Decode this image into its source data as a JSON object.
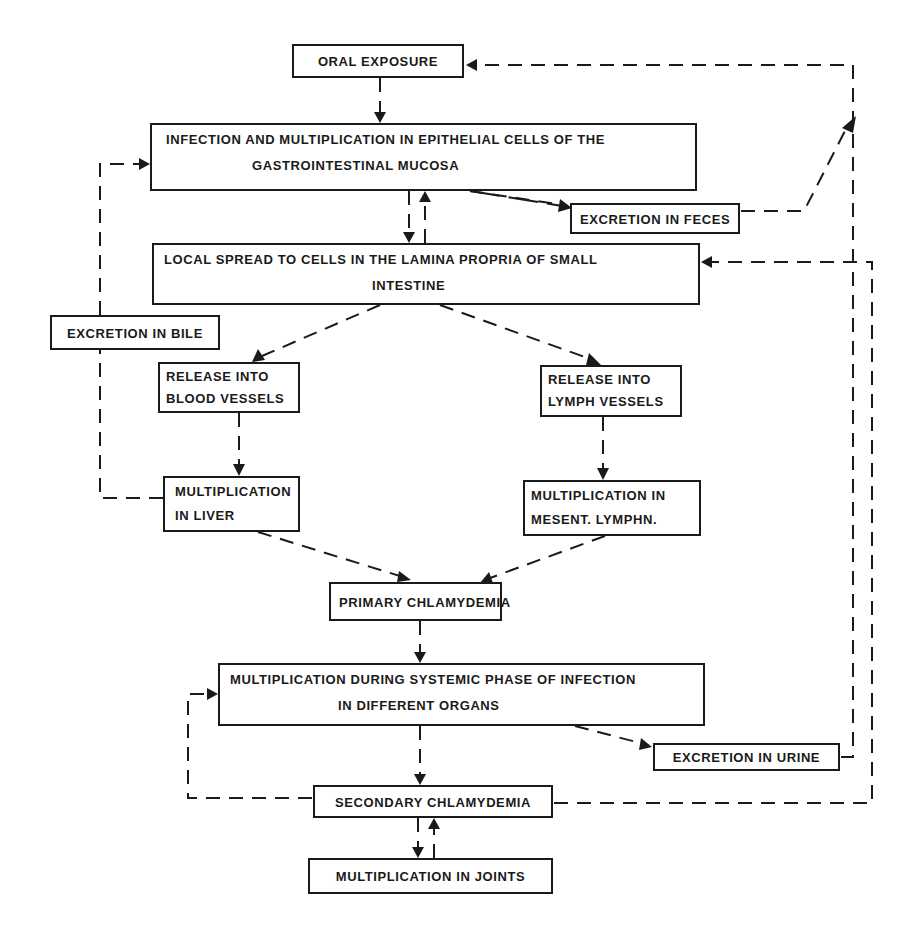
{
  "diagram": {
    "type": "flowchart",
    "line_color": "#1a1a1a",
    "background": "#ffffff",
    "nodes": {
      "oral_exposure": {
        "lines": [
          "ORAL EXPOSURE"
        ]
      },
      "infection": {
        "lines": [
          "INFECTION AND MULTIPLICATION IN EPITHELIAL CELLS OF THE",
          "GASTROINTESTINAL MUCOSA"
        ]
      },
      "excretion_feces": {
        "lines": [
          "EXCRETION IN FECES"
        ]
      },
      "local_spread": {
        "lines": [
          "LOCAL SPREAD TO CELLS IN THE LAMINA PROPRIA OF SMALL",
          "INTESTINE"
        ]
      },
      "excretion_bile": {
        "lines": [
          "EXCRETION IN BILE"
        ]
      },
      "release_blood": {
        "lines": [
          "RELEASE INTO",
          "BLOOD VESSELS"
        ]
      },
      "release_lymph": {
        "lines": [
          "RELEASE INTO",
          "LYMPH VESSELS"
        ]
      },
      "mult_liver": {
        "lines": [
          "MULTIPLICATION",
          "IN LIVER"
        ]
      },
      "mult_lymphn": {
        "lines": [
          "MULTIPLICATION IN",
          "MESENT. LYMPHN."
        ]
      },
      "primary_chlamydemia": {
        "lines": [
          "PRIMARY CHLAMYDEMIA"
        ]
      },
      "systemic": {
        "lines": [
          "MULTIPLICATION DURING SYSTEMIC PHASE OF INFECTION",
          "IN DIFFERENT ORGANS"
        ]
      },
      "excretion_urine": {
        "lines": [
          "EXCRETION IN URINE"
        ]
      },
      "secondary_chlamydemia": {
        "lines": [
          "SECONDARY CHLAMYDEMIA"
        ]
      },
      "mult_joints": {
        "lines": [
          "MULTIPLICATION IN JOINTS"
        ]
      }
    },
    "edges": [
      {
        "from": "oral_exposure",
        "to": "infection",
        "style": "dashed"
      },
      {
        "from": "infection",
        "to": "local_spread",
        "style": "dashed"
      },
      {
        "from": "local_spread",
        "to": "infection",
        "style": "dashed"
      },
      {
        "from": "infection",
        "to": "excretion_feces",
        "style": "dashed"
      },
      {
        "from": "excretion_feces",
        "to": "oral_exposure",
        "style": "dashed"
      },
      {
        "from": "local_spread",
        "to": "release_blood",
        "style": "dashed"
      },
      {
        "from": "local_spread",
        "to": "release_lymph",
        "style": "dashed"
      },
      {
        "from": "release_blood",
        "to": "mult_liver",
        "style": "dashed"
      },
      {
        "from": "release_lymph",
        "to": "mult_lymphn",
        "style": "dashed"
      },
      {
        "from": "mult_liver",
        "to": "excretion_bile",
        "style": "dashed"
      },
      {
        "from": "excretion_bile",
        "to": "infection",
        "style": "dashed"
      },
      {
        "from": "mult_liver",
        "to": "primary_chlamydemia",
        "style": "dashed"
      },
      {
        "from": "mult_lymphn",
        "to": "primary_chlamydemia",
        "style": "dashed"
      },
      {
        "from": "primary_chlamydemia",
        "to": "systemic",
        "style": "dashed"
      },
      {
        "from": "systemic",
        "to": "excretion_urine",
        "style": "dashed"
      },
      {
        "from": "excretion_urine",
        "to": "oral_exposure",
        "style": "dashed"
      },
      {
        "from": "systemic",
        "to": "secondary_chlamydemia",
        "style": "dashed"
      },
      {
        "from": "secondary_chlamydemia",
        "to": "systemic",
        "style": "dashed"
      },
      {
        "from": "secondary_chlamydemia",
        "to": "local_spread",
        "style": "dashed"
      },
      {
        "from": "secondary_chlamydemia",
        "to": "mult_joints",
        "style": "dashed"
      },
      {
        "from": "mult_joints",
        "to": "secondary_chlamydemia",
        "style": "dashed"
      }
    ]
  }
}
